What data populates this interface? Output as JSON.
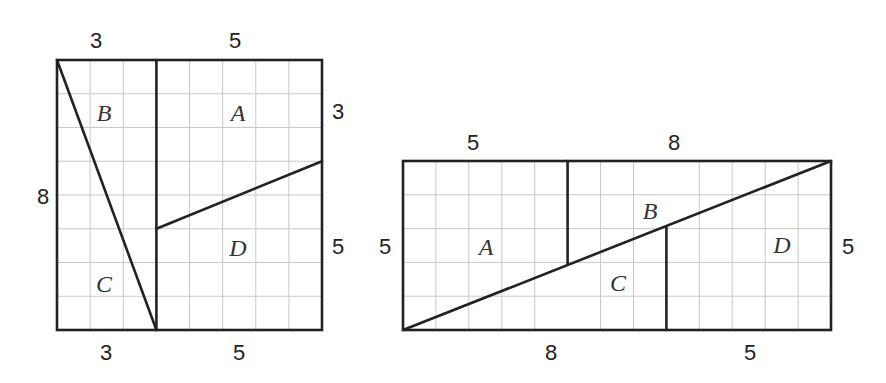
{
  "figure": {
    "title": "",
    "left_square": {
      "grid": {
        "cols": 8,
        "rows": 8
      },
      "pieces": [
        "A",
        "B",
        "C",
        "D"
      ],
      "top_labels": [
        "3",
        "5"
      ],
      "bottom_labels": [
        "3",
        "5"
      ],
      "left_label": "8",
      "right_labels": [
        "3",
        "5"
      ]
    },
    "right_rectangle": {
      "grid": {
        "cols": 13,
        "rows": 5
      },
      "pieces": [
        "A",
        "B",
        "C",
        "D"
      ],
      "top_labels": [
        "5",
        "8"
      ],
      "bottom_labels": [
        "8",
        "5"
      ],
      "left_label": "5",
      "right_label": "5"
    }
  }
}
